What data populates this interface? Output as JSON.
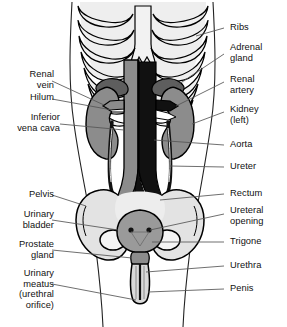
{
  "figure": {
    "background": "#ffffff"
  },
  "palette": {
    "outline": "#000000",
    "bone_light": "#e8e8e8",
    "bone_fill": "#efefef",
    "organ_gray": "#8c8c8c",
    "organ_gray_dark": "#6f6f6f",
    "vessel_dark": "#111111",
    "adrenal": "#5e5e5e",
    "bladder_gray": "#9a9a9a",
    "leader_line": "#555555",
    "text": "#111111"
  },
  "labels_left": [
    {
      "id": "renal-vein",
      "text": "Renal\nvein",
      "x": 20,
      "y": 74,
      "align": "right"
    },
    {
      "id": "hilum",
      "text": "Hilum",
      "x": 20,
      "y": 96,
      "align": "right"
    },
    {
      "id": "inferior-vena-cava",
      "text": "Inferior\nvena cava",
      "x": 8,
      "y": 117,
      "align": "right"
    },
    {
      "id": "pelvis",
      "text": "Pelvis",
      "x": 20,
      "y": 192,
      "align": "right"
    },
    {
      "id": "urinary-bladder",
      "text": "Urinary\nbladder",
      "x": 8,
      "y": 212,
      "align": "right"
    },
    {
      "id": "prostate-gland",
      "text": "Prostate\ngland",
      "x": 8,
      "y": 244,
      "align": "right"
    },
    {
      "id": "urinary-meatus",
      "text": "Urinary\nmeatus\n(urethral\norifice)",
      "x": 8,
      "y": 275,
      "align": "right"
    }
  ],
  "labels_right": [
    {
      "id": "ribs",
      "text": "Ribs",
      "x": 228,
      "y": 24,
      "align": "left"
    },
    {
      "id": "adrenal-gland",
      "text": "Adrenal\ngland",
      "x": 228,
      "y": 44,
      "align": "left"
    },
    {
      "id": "renal-artery",
      "text": "Renal\nartery",
      "x": 228,
      "y": 76,
      "align": "left"
    },
    {
      "id": "kidney-left",
      "text": "Kidney\n(left)",
      "x": 228,
      "y": 106,
      "align": "left"
    },
    {
      "id": "aorta",
      "text": "Aorta",
      "x": 228,
      "y": 141,
      "align": "left"
    },
    {
      "id": "ureter",
      "text": "Ureter",
      "x": 228,
      "y": 163,
      "align": "left"
    },
    {
      "id": "rectum",
      "text": "Rectum",
      "x": 228,
      "y": 190,
      "align": "left"
    },
    {
      "id": "ureteral-opening",
      "text": "Ureteral\nopening",
      "x": 228,
      "y": 208,
      "align": "left"
    },
    {
      "id": "trigone",
      "text": "Trigone",
      "x": 228,
      "y": 238,
      "align": "left"
    },
    {
      "id": "urethra",
      "text": "Urethra",
      "x": 228,
      "y": 262,
      "align": "left"
    },
    {
      "id": "penis",
      "text": "Penis",
      "x": 228,
      "y": 285,
      "align": "left"
    }
  ],
  "structures": [
    {
      "id": "rib-cage",
      "name": "Ribs"
    },
    {
      "id": "sternum",
      "name": "Sternum"
    },
    {
      "id": "adrenal-glands",
      "name": "Adrenal glands"
    },
    {
      "id": "kidney-right",
      "name": "Right kidney"
    },
    {
      "id": "kidney-left",
      "name": "Left kidney"
    },
    {
      "id": "vena-cava",
      "name": "Inferior vena cava"
    },
    {
      "id": "aorta",
      "name": "Aorta"
    },
    {
      "id": "renal-vessels",
      "name": "Renal artery and vein"
    },
    {
      "id": "ureters",
      "name": "Ureters"
    },
    {
      "id": "pelvis",
      "name": "Pelvis"
    },
    {
      "id": "bladder",
      "name": "Urinary bladder"
    },
    {
      "id": "ureteral-openings",
      "name": "Ureteral openings"
    },
    {
      "id": "urethra",
      "name": "Urethra"
    },
    {
      "id": "penis",
      "name": "Penis"
    },
    {
      "id": "body-outline",
      "name": "Torso outline"
    }
  ]
}
